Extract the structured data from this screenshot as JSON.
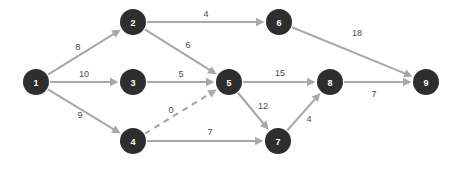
{
  "chart_data": {
    "type": "diagram",
    "title": "",
    "subtitle": "",
    "xlabel": "",
    "ylabel": "",
    "graph_kind": "directed-weighted-network",
    "colors": {
      "node_fill": "#2e2e2e",
      "node_text": "#ffffff",
      "edge": "#a8a8a8",
      "edge_label": "#4a4a4a",
      "background": "#ffffff"
    },
    "nodes": [
      {
        "id": "1",
        "label": "1",
        "x": 36,
        "y": 82,
        "r": 13
      },
      {
        "id": "2",
        "label": "2",
        "x": 133,
        "y": 22,
        "r": 13
      },
      {
        "id": "3",
        "label": "3",
        "x": 133,
        "y": 82,
        "r": 13
      },
      {
        "id": "4",
        "label": "4",
        "x": 133,
        "y": 141,
        "r": 13
      },
      {
        "id": "5",
        "label": "5",
        "x": 229,
        "y": 82,
        "r": 13
      },
      {
        "id": "6",
        "label": "6",
        "x": 279,
        "y": 22,
        "r": 13
      },
      {
        "id": "7",
        "label": "7",
        "x": 278,
        "y": 141,
        "r": 13
      },
      {
        "id": "8",
        "label": "8",
        "x": 330,
        "y": 82,
        "r": 13
      },
      {
        "id": "9",
        "label": "9",
        "x": 426,
        "y": 82,
        "r": 13
      }
    ],
    "edges": [
      {
        "id": "e1",
        "from": "1",
        "to": "2",
        "weight": "8",
        "style": "solid",
        "label_x": 78,
        "label_y": 47
      },
      {
        "id": "e2",
        "from": "1",
        "to": "3",
        "weight": "10",
        "style": "solid",
        "label_x": 84,
        "label_y": 74
      },
      {
        "id": "e3",
        "from": "1",
        "to": "4",
        "weight": "9",
        "style": "solid",
        "label_x": 80,
        "label_y": 115
      },
      {
        "id": "e4",
        "from": "2",
        "to": "6",
        "weight": "4",
        "style": "solid",
        "label_x": 206,
        "label_y": 14
      },
      {
        "id": "e5",
        "from": "2",
        "to": "5",
        "weight": "6",
        "style": "solid",
        "label_x": 188,
        "label_y": 45
      },
      {
        "id": "e6",
        "from": "3",
        "to": "5",
        "weight": "5",
        "style": "solid",
        "label_x": 181,
        "label_y": 74
      },
      {
        "id": "e7",
        "from": "4",
        "to": "5",
        "weight": "0",
        "style": "dashed",
        "label_x": 171,
        "label_y": 110
      },
      {
        "id": "e8",
        "from": "4",
        "to": "7",
        "weight": "7",
        "style": "solid",
        "label_x": 210,
        "label_y": 132
      },
      {
        "id": "e9",
        "from": "5",
        "to": "8",
        "weight": "15",
        "style": "solid",
        "label_x": 280,
        "label_y": 73
      },
      {
        "id": "e10",
        "from": "5",
        "to": "7",
        "weight": "12",
        "style": "solid",
        "label_x": 263,
        "label_y": 106
      },
      {
        "id": "e11",
        "from": "7",
        "to": "8",
        "weight": "4",
        "style": "solid",
        "label_x": 309,
        "label_y": 119
      },
      {
        "id": "e12",
        "from": "6",
        "to": "9",
        "weight": "18",
        "style": "solid",
        "label_x": 357,
        "label_y": 33
      },
      {
        "id": "e13",
        "from": "8",
        "to": "9",
        "weight": "7",
        "style": "solid",
        "label_x": 374,
        "label_y": 94
      }
    ]
  }
}
